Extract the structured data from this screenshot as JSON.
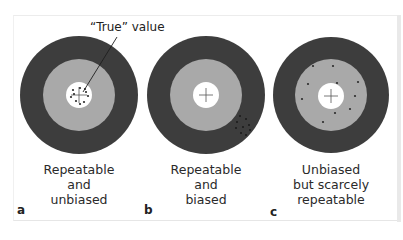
{
  "figure": {
    "annotation": "“True” value",
    "colors": {
      "outer_ring": "#3d3d3d",
      "middle_ring": "#a9a9a9",
      "center": "#ffffff",
      "dots": "#2b2b2b",
      "background": "#ffffff"
    },
    "panels": [
      {
        "letter": "a",
        "caption_lines": [
          "Repeatable",
          "and",
          "unbiased"
        ],
        "description": "dots tightly clustered on center"
      },
      {
        "letter": "b",
        "caption_lines": [
          "Repeatable",
          "and",
          "biased"
        ],
        "description": "dots tightly clustered in lower-right outer ring"
      },
      {
        "letter": "c",
        "caption_lines": [
          "Unbiased",
          "but scarcely",
          "repeatable"
        ],
        "description": "dots scattered around center in middle ring"
      }
    ]
  }
}
